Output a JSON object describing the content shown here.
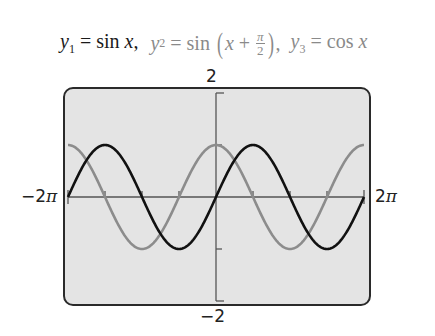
{
  "title": {
    "y1": {
      "lhs": "y",
      "sub": "1",
      "eq": " = sin ",
      "var": "x",
      "sep": ","
    },
    "y2": {
      "lhs": "y",
      "sub": "2",
      "eq": " = sin ",
      "var": "x",
      "plus": " + ",
      "frac_num": "π",
      "frac_den": "2",
      "sep": ","
    },
    "y3": {
      "lhs": "y",
      "sub": "3",
      "eq": " = cos ",
      "var": "x"
    }
  },
  "axes": {
    "ymax_label": "2",
    "ymin_label": "−2",
    "xmin_label": "−2",
    "xmax_label": "2",
    "pi_symbol": "π"
  },
  "colors": {
    "y1": "#111111",
    "y2_y3": "#8c8c8c",
    "screen_bg": "#e4e4e4",
    "frame": "#2a2a2a"
  },
  "chart_data": {
    "type": "line",
    "xlabel": "",
    "ylabel": "",
    "xlim": [
      -6.2832,
      6.2832
    ],
    "ylim": [
      -2,
      2
    ],
    "x_tick_step": 1.5708,
    "y_tick_step": 1,
    "grid": false,
    "legend": "none",
    "series": [
      {
        "name": "y1 = sin x",
        "color": "#111111",
        "function": "sin(x)",
        "x": [
          -6.2832,
          -4.7124,
          -3.1416,
          -1.5708,
          0,
          1.5708,
          3.1416,
          4.7124,
          6.2832
        ],
        "values": [
          0,
          1,
          0,
          -1,
          0,
          1,
          0,
          -1,
          0
        ]
      },
      {
        "name": "y2 = sin(x + π/2)",
        "color": "#8c8c8c",
        "function": "sin(x + π/2)",
        "x": [
          -6.2832,
          -4.7124,
          -3.1416,
          -1.5708,
          0,
          1.5708,
          3.1416,
          4.7124,
          6.2832
        ],
        "values": [
          1,
          0,
          -1,
          0,
          1,
          0,
          -1,
          0,
          1
        ]
      },
      {
        "name": "y3 = cos x",
        "color": "#8c8c8c",
        "function": "cos(x)",
        "x": [
          -6.2832,
          -4.7124,
          -3.1416,
          -1.5708,
          0,
          1.5708,
          3.1416,
          4.7124,
          6.2832
        ],
        "values": [
          1,
          0,
          -1,
          0,
          1,
          0,
          -1,
          0,
          1
        ]
      }
    ],
    "annotations": [
      "y2 and y3 coincide"
    ]
  }
}
